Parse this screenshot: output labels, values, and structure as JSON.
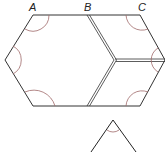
{
  "diagram": {
    "type": "geometry",
    "labels": {
      "a": "A",
      "b": "B",
      "c": "C"
    },
    "colors": {
      "line": "#333333",
      "arc": "#a06a6a",
      "background": "#ffffff"
    },
    "shapes": {
      "hexagon": {
        "vertices": [
          [
            33,
            15
          ],
          [
            140,
            15
          ],
          [
            165,
            60
          ],
          [
            140,
            106
          ],
          [
            33,
            106
          ],
          [
            5,
            60
          ]
        ]
      },
      "divider_lines": [
        {
          "from": [
            88,
            15
          ],
          "to": [
            115,
            60
          ],
          "style": "double"
        },
        {
          "from": [
            115,
            60
          ],
          "to": [
            88,
            106
          ],
          "style": "double"
        },
        {
          "from": [
            115,
            60
          ],
          "to": [
            165,
            60
          ],
          "style": "double"
        }
      ],
      "triangle": {
        "apex": [
          113,
          120
        ],
        "left": [
          92,
          152
        ],
        "right": [
          135,
          152
        ]
      }
    }
  }
}
